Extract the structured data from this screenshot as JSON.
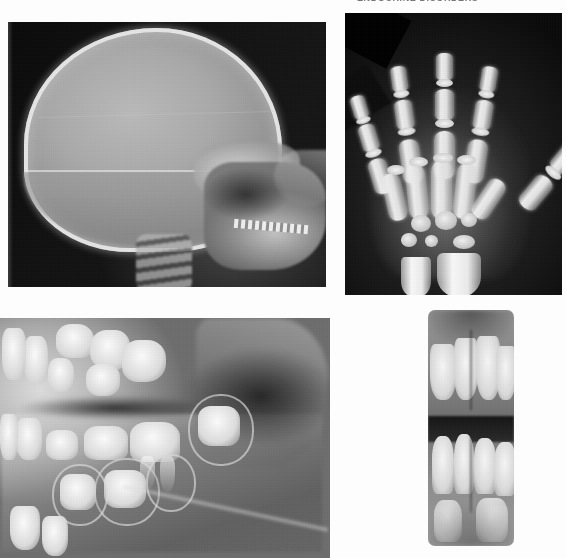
{
  "figure": {
    "caption_top": "ENDOCRINE DISORDERS",
    "layout": "2x2 radiograph plate",
    "background_color": "#fdfdfd",
    "width": 566,
    "height": 558
  },
  "panels": [
    {
      "id": "panel-skull",
      "position": "top-left",
      "label": "Lateral skull radiograph",
      "modality": "plain radiograph",
      "view": "lateral",
      "region": "skull",
      "features": [
        "enlarged calvarium with thin cortical outline",
        "horizontal beam / artefact line across cranial vault",
        "skull base and sella region",
        "facial bones with maxilla and mandible",
        "erupted and unerupted dentition at occlusal level",
        "cervical spine"
      ],
      "film_background": "#101010"
    },
    {
      "id": "panel-hand",
      "position": "top-right",
      "label": "Hand and wrist radiograph (bone age)",
      "modality": "plain radiograph",
      "view": "posteroanterior",
      "region": "left hand and wrist",
      "features": [
        "five digital rays with phalanges",
        "metacarpals with proximal epiphyses",
        "small number of ossified carpal centres",
        "distal radius and ulna metaphyses",
        "delayed skeletal maturation"
      ],
      "film_background": "#1b1b1b"
    },
    {
      "id": "panel-pano",
      "position": "bottom-left",
      "label": "Panoramic dental radiograph, right quadrant",
      "modality": "panoramic radiograph",
      "view": "lateral oblique",
      "region": "maxilla and mandible",
      "features": [
        "multiple unerupted tooth crowns",
        "pericoronal follicular spaces",
        "developing permanent molars",
        "resorbing deciduous teeth",
        "mandibular body and ramus"
      ],
      "film_background": "#6d6d6d"
    },
    {
      "id": "panel-periapical",
      "position": "bottom-right",
      "label": "Anterior periapical radiograph",
      "modality": "intraoral periapical radiograph",
      "view": "anterior",
      "region": "maxillary and mandibular incisors",
      "features": [
        "maxillary central and lateral incisors",
        "mandibular incisors",
        "open occlusal space",
        "alveolar bone and midline"
      ],
      "film_background": "#8e8e8e"
    }
  ],
  "hand_anatomy": {
    "rays": [
      {
        "name": "thumb",
        "rotation": 42,
        "left": 150,
        "top": 122,
        "segments": 2
      },
      {
        "name": "index",
        "rotation": 9,
        "left": 112,
        "top": 62,
        "segments": 3
      },
      {
        "name": "middle",
        "rotation": 0,
        "left": 86,
        "top": 46,
        "segments": 3
      },
      {
        "name": "ring",
        "rotation": -8,
        "left": 58,
        "top": 62,
        "segments": 3
      },
      {
        "name": "little",
        "rotation": -18,
        "left": 34,
        "top": 88,
        "segments": 3
      }
    ],
    "carpal_count": 6
  }
}
